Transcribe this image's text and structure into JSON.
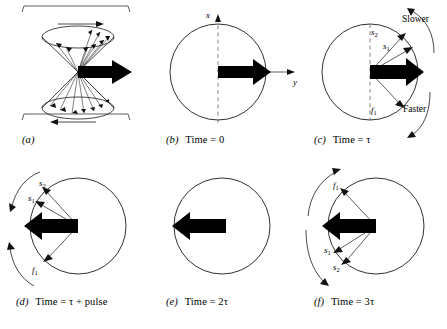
{
  "figure": {
    "type": "spin-echo-vector-diagram",
    "panel_count": 6
  },
  "panels": [
    {
      "id": "a",
      "caption_label": "(a)",
      "caption_text": "",
      "diagram": "double-cone-precession",
      "has_brackets": true,
      "has_circle": false,
      "has_axes": false
    },
    {
      "id": "b",
      "caption_label": "(b)",
      "caption_text": "Time = 0",
      "diagram": "single-vector",
      "has_circle": true,
      "has_axes": true,
      "axis_x_label": "x",
      "axis_y_label": "y",
      "arrow_direction": "right"
    },
    {
      "id": "c",
      "caption_label": "(c)",
      "caption_text": "Time = τ",
      "diagram": "fanning-vectors",
      "has_circle": true,
      "has_dashed_axis": true,
      "arrow_direction": "right",
      "vector_labels": [
        "s₂",
        "s₁",
        "f₁"
      ],
      "annotation_top": "Slower",
      "annotation_bottom": "Faster"
    },
    {
      "id": "d",
      "caption_label": "(d)",
      "caption_text": "Time = τ + pulse",
      "diagram": "fanning-vectors-flipped",
      "has_circle": true,
      "arrow_direction": "left",
      "vector_labels": [
        "s₂",
        "s₁",
        "f₁"
      ]
    },
    {
      "id": "e",
      "caption_label": "(e)",
      "caption_text": "Time = 2τ",
      "diagram": "refocused-vector",
      "has_circle": true,
      "arrow_direction": "left",
      "vector_labels": []
    },
    {
      "id": "f",
      "caption_label": "(f)",
      "caption_text": "Time = 3τ",
      "diagram": "fanning-vectors-reversed",
      "has_circle": true,
      "arrow_direction": "left",
      "vector_labels": [
        "f₁",
        "s₁",
        "s₂"
      ]
    }
  ],
  "labels": {
    "s2": "s",
    "s1": "s",
    "f1": "f",
    "sub2": "2",
    "sub1": "1",
    "axis_x": "x",
    "axis_y": "y",
    "slower": "Slower",
    "faster": "Faster"
  },
  "captions": {
    "a_label": "(a)",
    "a_text": "",
    "b_label": "(b)",
    "b_text": "Time = 0",
    "c_label": "(c)",
    "c_text": "Time = τ",
    "d_label": "(d)",
    "d_text": "Time = τ + pulse",
    "e_label": "(e)",
    "e_text": "Time = 2τ",
    "f_label": "(f)",
    "f_text": "Time = 3τ"
  },
  "colors": {
    "ink": "#1a1a1a",
    "arrow_fill": "#000000",
    "thin_line": "#2b2b2b",
    "dashed": "#555555",
    "background": "#ffffff"
  }
}
